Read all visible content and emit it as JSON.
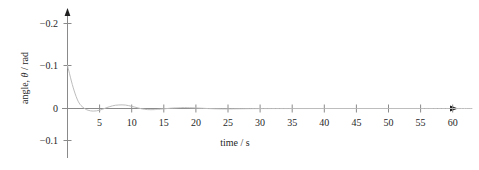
{
  "chart_data": {
    "type": "line",
    "title": "",
    "xlabel": "time / s",
    "ylabel_text": "angle, ",
    "ylabel_symbol": "θ",
    "ylabel_unit": " / rad",
    "ylabel_full": "angle, θ / rad",
    "xlim": [
      0,
      63
    ],
    "ylim_labels_top_to_bottom": [
      "−0.2",
      "−0.1",
      "0",
      "−0.1"
    ],
    "y_tick_values": [
      -0.2,
      -0.1,
      0,
      -0.1
    ],
    "x_tick_labels": [
      "5",
      "10",
      "15",
      "20",
      "25",
      "30",
      "35",
      "40",
      "45",
      "50",
      "55",
      "60"
    ],
    "x_tick_values": [
      5,
      10,
      15,
      20,
      25,
      30,
      35,
      40,
      45,
      50,
      55,
      60
    ],
    "grid": false,
    "legend": null,
    "axis_style": "arrow-terminated axes, y-axis inverted (negative upward)",
    "curve_color": "#bdbdbd",
    "axis_color": "#8a8a8a",
    "text_color": "#1f1f1f",
    "series": [
      {
        "name": "angle",
        "description": "damped oscillation decaying from -0.1 rad toward 0",
        "x": [
          0,
          0.3,
          0.6,
          0.9,
          1.2,
          1.5,
          1.8,
          2.1,
          2.4,
          2.8,
          3.2,
          3.6,
          4.0,
          4.5,
          5.0,
          5.5,
          6.0,
          6.5,
          7.0,
          7.5,
          8.0,
          8.5,
          9.0,
          9.5,
          10.0,
          10.5,
          11.0,
          11.5,
          12.0,
          12.5,
          13.0,
          13.5,
          14.0,
          15.0,
          16.0,
          17.0,
          17.5,
          18.0,
          19.0,
          20.0,
          21.0,
          22.0,
          23.0,
          24.0,
          25.0,
          27.0,
          30.0,
          35.0,
          40.0,
          45.0,
          50.0,
          55.0,
          60.0,
          63.0
        ],
        "y": [
          -0.1,
          -0.082,
          -0.064,
          -0.048,
          -0.034,
          -0.022,
          -0.013,
          -0.007,
          -0.003,
          0.0015,
          0.004,
          0.0055,
          0.006,
          0.0055,
          0.004,
          0.0015,
          -0.0015,
          -0.004,
          -0.0062,
          -0.0076,
          -0.0082,
          -0.0084,
          -0.008,
          -0.0068,
          -0.005,
          -0.0032,
          -0.0013,
          0.0005,
          0.0018,
          0.0026,
          0.0028,
          0.0026,
          0.0021,
          0.0008,
          -0.0006,
          -0.0015,
          -0.0019,
          -0.002,
          -0.0018,
          -0.0012,
          -0.0005,
          0.0002,
          0.0007,
          0.001,
          0.001,
          0.0006,
          0.0002,
          0.0001,
          0.0,
          0.0,
          0.0,
          0.0,
          0.0,
          0.0
        ]
      }
    ]
  },
  "axes": {
    "x_axis_name": "time-axis",
    "y_axis_name": "angle-axis"
  }
}
